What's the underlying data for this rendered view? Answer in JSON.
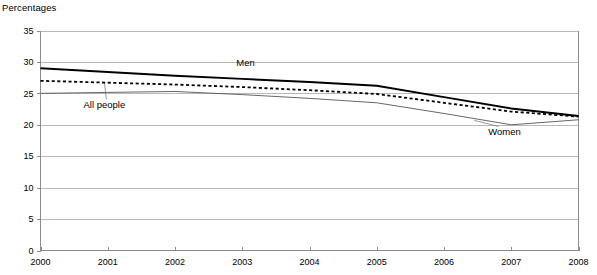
{
  "axis_title": "Percentages",
  "chart_data": {
    "type": "line",
    "title": "",
    "subtitle": "",
    "xlabel": "",
    "ylabel": "Percentages",
    "x": [
      2000,
      2001,
      2002,
      2003,
      2004,
      2005,
      2006,
      2007,
      2008
    ],
    "categories": [
      "2000",
      "2001",
      "2002",
      "2003",
      "2004",
      "2005",
      "2006",
      "2007",
      "2008"
    ],
    "xlim": [
      2000,
      2008
    ],
    "ylim": [
      0,
      35
    ],
    "yticks": [
      0,
      5,
      10,
      15,
      20,
      25,
      30,
      35
    ],
    "ytick_labels": [
      "0",
      "5",
      "10",
      "15",
      "20",
      "25",
      "30",
      "35"
    ],
    "grid": true,
    "legend_position": "inline-annotations",
    "series": [
      {
        "name": "Men",
        "style": "solid",
        "color": "#000000",
        "values": [
          29.0,
          28.4,
          27.8,
          27.3,
          26.8,
          26.2,
          24.4,
          22.6,
          21.4
        ],
        "label_x": 2003.05,
        "label_y": 29.4
      },
      {
        "name": "All people",
        "style": "dotted",
        "color": "#000000",
        "values": [
          27.0,
          26.7,
          26.4,
          26.0,
          25.5,
          24.9,
          23.5,
          22.1,
          21.3
        ],
        "label_x": 2000.95,
        "label_y": 22.6
      },
      {
        "name": "Women",
        "style": "thin-solid",
        "color": "#555555",
        "values": [
          25.0,
          25.15,
          25.3,
          24.8,
          24.2,
          23.5,
          21.8,
          20.0,
          20.8
        ],
        "label_x": 2006.9,
        "label_y": 18.3
      }
    ],
    "annotations": [
      {
        "text": "Men",
        "target_series": "Men"
      },
      {
        "text": "All people",
        "target_series": "All people",
        "leader_line": true
      },
      {
        "text": "Women",
        "target_series": "Women",
        "leader_line": true
      }
    ]
  }
}
